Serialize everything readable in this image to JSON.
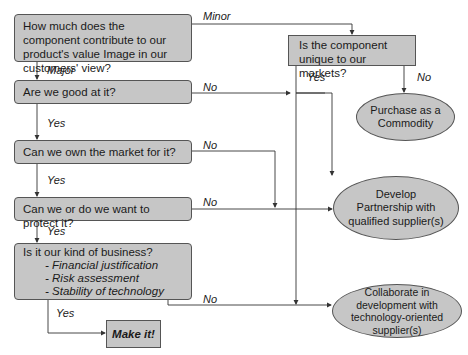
{
  "diagram": {
    "type": "flowchart",
    "decisions": {
      "value_contribution": "How much does the component contribute to our product's value Image in our customers' view?",
      "unique": "Is the component unique to our markets?",
      "good_at": "Are we good at it?",
      "own_market": "Can we own the market for it?",
      "protect": "Can we or do we want to protect it?",
      "our_business": {
        "title": "Is it our kind of business?",
        "criteria": [
          "- Financial justification",
          "- Risk assessment",
          "- Stability of technology"
        ]
      }
    },
    "outcomes": {
      "make": "Make it!",
      "commodity": "Purchase as a Commodity",
      "partnership": "Develop Partnership with qualified supplier(s)",
      "collaborate": "Collaborate in development with technology-oriented supplier(s)"
    },
    "edge_labels": {
      "minor": "Minor",
      "major": "Major",
      "unique_yes": "Yes",
      "unique_no": "No",
      "good_no": "No",
      "good_yes": "Yes",
      "own_no": "No",
      "own_yes": "Yes",
      "protect_no": "No",
      "protect_yes": "Yes",
      "business_no": "No",
      "business_yes": "Yes"
    },
    "colors": {
      "fill": "#c6c6c6",
      "stroke": "#555555",
      "line": "#333333"
    }
  }
}
